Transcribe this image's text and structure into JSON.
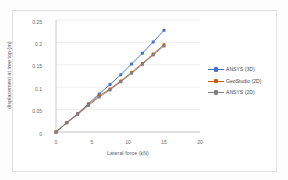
{
  "chart_data": {
    "type": "line",
    "title": "",
    "xlabel": "Lateral force (kN)",
    "ylabel": "displacement at tree top (m)",
    "xlim": [
      0,
      20
    ],
    "ylim": [
      0,
      0.25
    ],
    "xticks": [
      "0",
      "5",
      "10",
      "15",
      "20"
    ],
    "yticks": [
      "0",
      "0.05",
      "0.1",
      "0.15",
      "0.2",
      "0.25"
    ],
    "grid": "horizontal",
    "legend_position": "right",
    "series": [
      {
        "name": "ANSYS (3D)",
        "color": "#4472C4",
        "marker": "square",
        "x": [
          0,
          1.5,
          3,
          4.5,
          6,
          7.5,
          9,
          10.5,
          12,
          13.5,
          15
        ],
        "values": [
          0,
          0.021,
          0.041,
          0.063,
          0.085,
          0.106,
          0.128,
          0.152,
          0.176,
          0.201,
          0.227
        ]
      },
      {
        "name": "GeoStudio (2D)",
        "color": "#C55A11",
        "marker": "square",
        "x": [
          0,
          1.5,
          3,
          4.5,
          6,
          7.5,
          9,
          10.5,
          12,
          13.5,
          15
        ],
        "values": [
          0,
          0.021,
          0.04,
          0.061,
          0.081,
          0.096,
          0.114,
          0.133,
          0.153,
          0.174,
          0.195
        ]
      },
      {
        "name": "ANSYS (2D)",
        "color": "#808080",
        "marker": "square",
        "x": [
          0,
          1.5,
          3,
          4.5,
          6,
          7.5,
          9,
          10.5,
          12,
          13.5,
          15
        ],
        "values": [
          0,
          0.02,
          0.039,
          0.059,
          0.078,
          0.094,
          0.112,
          0.131,
          0.151,
          0.172,
          0.192
        ]
      }
    ]
  },
  "legend": {
    "items": [
      {
        "label": "ANSYS (3D)"
      },
      {
        "label": "GeoStudio (2D)"
      },
      {
        "label": "ANSYS (2D)"
      }
    ]
  }
}
